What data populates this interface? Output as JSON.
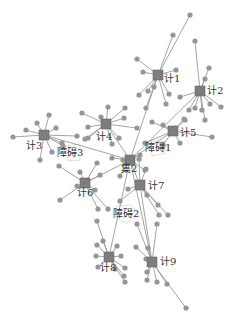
{
  "diagram": {
    "type": "network-graph",
    "colors": {
      "edge": "#9a9a9a",
      "leaf": "#969696",
      "hub": "#7d7d7d",
      "obstacle": "#d4d4d4",
      "label": "#333333"
    },
    "hubs": [
      {
        "id": "h1",
        "label": "计1",
        "x": 158,
        "y": 75,
        "lx": 164,
        "ly": 82,
        "leaves": [
          [
            190,
            15
          ],
          [
            173,
            35
          ],
          [
            137,
            59
          ],
          [
            143,
            72
          ],
          [
            176,
            70
          ],
          [
            154,
            87
          ],
          [
            148,
            91
          ],
          [
            139,
            95
          ],
          [
            146,
            108
          ],
          [
            166,
            104
          ],
          [
            169,
            94
          ]
        ]
      },
      {
        "id": "h2",
        "label": "计2",
        "x": 200,
        "y": 91,
        "lx": 207,
        "ly": 94,
        "leaves": [
          [
            195,
            41
          ],
          [
            209,
            68
          ],
          [
            205,
            79
          ],
          [
            180,
            97
          ],
          [
            189,
            110
          ],
          [
            195,
            108
          ],
          [
            202,
            110
          ],
          [
            210,
            104
          ],
          [
            221,
            107
          ],
          [
            205,
            120
          ]
        ]
      },
      {
        "id": "h3",
        "label": "计3",
        "x": 44,
        "y": 135,
        "lx": 26,
        "ly": 149,
        "leaves": [
          [
            13,
            137
          ],
          [
            26,
            130
          ],
          [
            37,
            123
          ],
          [
            49,
            115
          ],
          [
            56,
            128
          ],
          [
            77,
            136
          ],
          [
            63,
            146
          ],
          [
            52,
            152
          ],
          [
            40,
            160
          ],
          [
            62,
            143
          ]
        ]
      },
      {
        "id": "h4",
        "label": "计4",
        "x": 106,
        "y": 124,
        "lx": 96,
        "ly": 140,
        "leaves": [
          [
            82,
            113
          ],
          [
            88,
            127
          ],
          [
            101,
            117
          ],
          [
            108,
            107
          ],
          [
            125,
            108
          ],
          [
            124,
            118
          ],
          [
            137,
            128
          ],
          [
            119,
            138
          ],
          [
            112,
            144
          ],
          [
            88,
            138
          ],
          [
            85,
            139
          ]
        ]
      },
      {
        "id": "h5",
        "label": "计5",
        "x": 173,
        "y": 131,
        "lx": 180,
        "ly": 136,
        "leaves": [
          [
            152,
            122
          ],
          [
            163,
            125
          ],
          [
            185,
            120
          ],
          [
            184,
            119
          ],
          [
            212,
            137
          ],
          [
            180,
            143
          ],
          [
            163,
            145
          ],
          [
            145,
            143
          ],
          [
            175,
            128
          ]
        ]
      },
      {
        "id": "hc",
        "label": "集2",
        "x": 130,
        "y": 160,
        "lx": 121,
        "ly": 172,
        "leaves": [
          [
            112,
            158
          ],
          [
            140,
            155
          ],
          [
            145,
            170
          ],
          [
            120,
            176
          ],
          [
            123,
            160
          ]
        ]
      },
      {
        "id": "h6",
        "label": "计6",
        "x": 85,
        "y": 183,
        "lx": 77,
        "ly": 196,
        "leaves": [
          [
            59,
            166
          ],
          [
            80,
            172
          ],
          [
            97,
            163
          ],
          [
            100,
            175
          ],
          [
            77,
            186
          ],
          [
            95,
            190
          ],
          [
            60,
            200
          ],
          [
            98,
            209
          ],
          [
            108,
            209
          ]
        ]
      },
      {
        "id": "h7",
        "label": "计7",
        "x": 140,
        "y": 185,
        "lx": 148,
        "ly": 189,
        "leaves": [
          [
            139,
            159
          ],
          [
            146,
            169
          ],
          [
            128,
            189
          ],
          [
            120,
            201
          ],
          [
            158,
            205
          ],
          [
            159,
            215
          ],
          [
            168,
            215
          ],
          [
            147,
            195
          ]
        ]
      },
      {
        "id": "h8",
        "label": "计8",
        "x": 109,
        "y": 257,
        "lx": 100,
        "ly": 271,
        "leaves": [
          [
            97,
            221
          ],
          [
            97,
            245
          ],
          [
            117,
            246
          ],
          [
            96,
            256
          ],
          [
            121,
            256
          ],
          [
            98,
            267
          ],
          [
            125,
            268
          ],
          [
            124,
            276
          ],
          [
            125,
            282
          ],
          [
            115,
            269
          ],
          [
            103,
            241
          ]
        ]
      },
      {
        "id": "h9",
        "label": "计9",
        "x": 152,
        "y": 262,
        "lx": 160,
        "ly": 265,
        "leaves": [
          [
            137,
            224
          ],
          [
            136,
            247
          ],
          [
            148,
            248
          ],
          [
            157,
            224
          ],
          [
            147,
            272
          ],
          [
            147,
            280
          ],
          [
            157,
            282
          ],
          [
            167,
            284
          ],
          [
            186,
            308
          ],
          [
            146,
            259
          ]
        ]
      }
    ],
    "hub_links": [
      [
        "hc",
        "h1"
      ],
      [
        "hc",
        "h4"
      ],
      [
        "hc",
        "h5"
      ],
      [
        "hc",
        "h3"
      ],
      [
        "hc",
        "h6"
      ],
      [
        "hc",
        "h7"
      ],
      [
        "hc",
        "h8"
      ],
      [
        "hc",
        "h2"
      ],
      [
        "h7",
        "h9"
      ],
      [
        "hc",
        "h9"
      ]
    ],
    "obstacles": [
      {
        "id": "o3",
        "label": "障碍3",
        "lx": 57,
        "ly": 156,
        "points": "66,146 80,144 80,160 68,161"
      },
      {
        "id": "o1",
        "label": "障碍1",
        "lx": 145,
        "ly": 151,
        "points": "151,141 165,141 165,153 152,156"
      },
      {
        "id": "o2",
        "label": "障碍2",
        "lx": 113,
        "ly": 217,
        "points": "117,206 131,205 138,213 127,223 116,218"
      }
    ]
  }
}
